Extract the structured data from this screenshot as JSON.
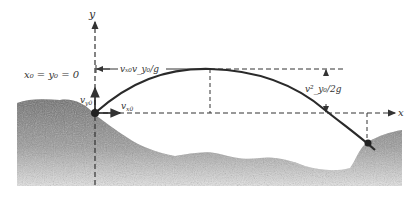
{
  "diagram": {
    "type": "projectile-motion",
    "colors": {
      "ground": "#6e6e6e",
      "ground_light": "#bdbdbd",
      "trajectory": "#2a2a2a",
      "axes": "#333333"
    },
    "labels": {
      "y_axis": "y",
      "x_axis": "x",
      "origin": "x₀ = y₀ = 0",
      "vy0": "v",
      "vy0_sub": "y0",
      "vx0": "v",
      "vx0_sub": "x0",
      "range_to_peak": "vₓ₀v_y₀/g",
      "max_height": "v²_y₀/2g"
    }
  }
}
